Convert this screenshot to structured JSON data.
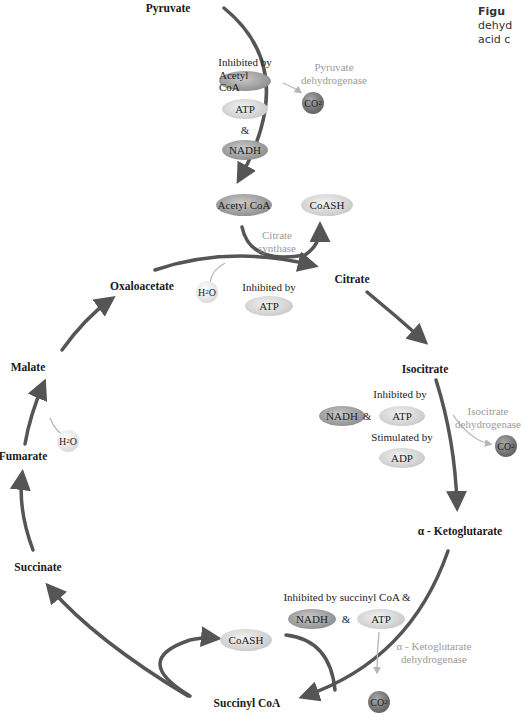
{
  "caption": {
    "title_fragment": "Figu",
    "line2_fragment": "dehyd",
    "line3_fragment": "acid c"
  },
  "metabolites": {
    "pyruvate": "Pyruvate",
    "citrate": "Citrate",
    "isocitrate": "Isocitrate",
    "alpha_ketoglutarate": "α - Ketoglutarate",
    "succinyl_coa": "Succinyl CoA",
    "succinate": "Succinate",
    "fumarate": "Fumarate",
    "malate": "Malate",
    "oxaloacetate": "Oxaloacetate"
  },
  "enzymes": {
    "pyruvate_dh": [
      "Pyruvate",
      "dehydrogenase"
    ],
    "citrate_synthase": [
      "Citrate",
      "synthase"
    ],
    "isocitrate_dh": [
      "Isocitrate",
      "dehydrogenase"
    ],
    "akg_dh": [
      "α - Ketoglutarate",
      "dehydrogenase"
    ]
  },
  "regulation": {
    "pdh": {
      "label": "Inhibited by",
      "items": [
        "Acetyl CoA",
        "ATP",
        "NADH"
      ],
      "amp": "&"
    },
    "citrate_synthase": {
      "label": "Inhibited by",
      "items": [
        "ATP"
      ]
    },
    "idh": {
      "inhibit_label": "Inhibited by",
      "inhibitors": [
        "NADH",
        "ATP"
      ],
      "amp": "&",
      "stim_label": "Stimulated by",
      "stimulators": [
        "ADP"
      ]
    },
    "akgdh": {
      "label": "Inhibited by succinyl CoA &",
      "items": [
        "NADH",
        "ATP"
      ],
      "amp": "&"
    }
  },
  "cofactors": {
    "acetyl_coa": "Acetyl CoA",
    "coash_top": "CoASH",
    "coash_bottom": "CoASH",
    "co2_label": "CO",
    "co2_sub": "2",
    "h2o_h": "H",
    "h2o_sub": "2",
    "h2o_o": "O"
  },
  "colors": {
    "arrow": "#555555",
    "enzyme_text": "#9a9a9a",
    "thin_arrow": "#b5b5b5"
  }
}
